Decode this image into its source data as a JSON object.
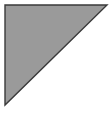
{
  "image": {
    "width": 110,
    "height": 115,
    "background_color": "#ffffff",
    "description": "right-triangle"
  },
  "shape": {
    "name": "right-triangle",
    "type": "polygon",
    "fill_color": "#9a9a9a",
    "stroke_color": "#3a3a3a",
    "stroke_width": 1.4,
    "right_angle_corner": "top-left",
    "points": "5,5 107,5 5,105",
    "vertices": [
      {
        "label": "top-left",
        "x": 5,
        "y": 5
      },
      {
        "label": "top-right",
        "x": 107,
        "y": 5
      },
      {
        "label": "bottom-left",
        "x": 5,
        "y": 105
      }
    ]
  }
}
